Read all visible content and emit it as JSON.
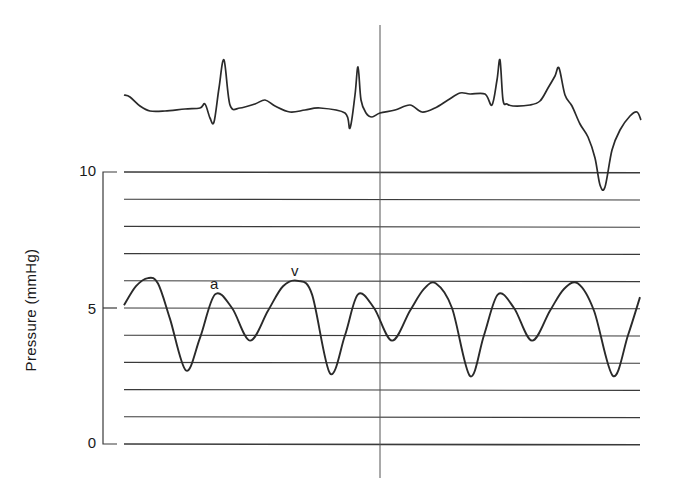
{
  "chart_data": {
    "type": "line",
    "title": "",
    "xlabel": "",
    "ylabel": "Pressure (mmHg)",
    "ylim": [
      0,
      10
    ],
    "yticks": [
      0,
      5,
      10
    ],
    "ytick_labels": [
      "0",
      "5",
      "10"
    ],
    "grid": {
      "horizontal": true,
      "count": 11,
      "spacing": 1
    },
    "legend": null,
    "annotations": [
      {
        "text": "a",
        "description": "atrial contraction wave",
        "x_px": 215,
        "value": 5.5
      },
      {
        "text": "v",
        "description": "ventricular filling wave",
        "x_px": 296,
        "value": 6.0
      }
    ],
    "marker_line": {
      "description": "vertical timing marker through ECG and pressure trace",
      "x_px": 380
    },
    "series": [
      {
        "name": "ECG",
        "description": "Electrocardiogram trace above pressure grid (no scale)",
        "x_px": [
          124,
          130,
          140,
          150,
          165,
          185,
          200,
          205,
          210,
          214,
          219,
          224,
          230,
          240,
          255,
          265,
          275,
          290,
          305,
          320,
          345,
          350,
          355,
          358,
          361,
          366,
          372,
          380,
          395,
          410,
          422,
          435,
          448,
          460,
          470,
          485,
          492,
          497,
          500,
          503,
          507,
          513,
          530,
          540,
          548,
          555,
          559,
          565,
          572,
          580,
          588,
          595,
          600,
          605,
          612,
          620,
          630,
          637,
          641
        ],
        "y_px": [
          95,
          97,
          106,
          111,
          111,
          109,
          108,
          104,
          118,
          122,
          88,
          60,
          105,
          108,
          104,
          100,
          106,
          112,
          110,
          108,
          113,
          128,
          95,
          67,
          100,
          113,
          117,
          113,
          110,
          105,
          112,
          108,
          100,
          93,
          94,
          94,
          105,
          80,
          60,
          100,
          104,
          106,
          105,
          101,
          88,
          76,
          68,
          95,
          106,
          124,
          137,
          158,
          185,
          187,
          150,
          130,
          116,
          112,
          120
        ]
      },
      {
        "name": "Pressure",
        "description": "Venous/atrial pressure waveform in mmHg with a and v waves",
        "x_px": [
          124,
          136,
          148,
          158,
          170,
          186,
          200,
          215,
          232,
          250,
          268,
          283,
          298,
          312,
          330,
          345,
          358,
          374,
          392,
          410,
          424,
          436,
          452,
          470,
          484,
          498,
          514,
          532,
          550,
          564,
          578,
          594,
          613,
          628,
          640
        ],
        "values": [
          5.1,
          5.8,
          6.1,
          5.9,
          4.6,
          2.7,
          3.9,
          5.5,
          5.0,
          3.8,
          4.9,
          5.8,
          6.0,
          5.5,
          2.6,
          4.0,
          5.5,
          5.0,
          3.8,
          4.9,
          5.7,
          5.9,
          5.0,
          2.5,
          4.0,
          5.5,
          5.0,
          3.8,
          4.9,
          5.7,
          5.9,
          4.9,
          2.5,
          4.0,
          5.4
        ]
      }
    ]
  },
  "axis": {
    "label": "Pressure (mmHg)",
    "ticks": [
      {
        "label": "10",
        "value": 10
      },
      {
        "label": "5",
        "value": 5
      },
      {
        "label": "0",
        "value": 0
      }
    ]
  },
  "annotations": {
    "a_label": "a",
    "v_label": "v"
  },
  "colors": {
    "trace": "#2a2a2a",
    "grid": "#3a3a3a",
    "background": "#ffffff"
  }
}
